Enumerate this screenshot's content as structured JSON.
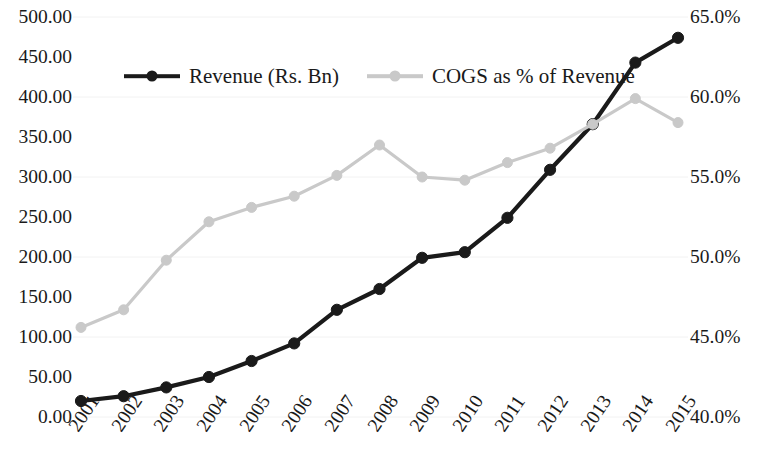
{
  "chart_data": {
    "type": "line",
    "title": "",
    "subtitle": "",
    "xlabel": "",
    "ylabel": "",
    "grid": false,
    "legend_position": "top-left",
    "categories": [
      "2001",
      "2002",
      "2003",
      "2004",
      "2005",
      "2006",
      "2007",
      "2008",
      "2009",
      "2010",
      "2011",
      "2012",
      "2013",
      "2014",
      "2015"
    ],
    "x": [
      2001,
      2002,
      2003,
      2004,
      2005,
      2006,
      2007,
      2008,
      2009,
      2010,
      2011,
      2012,
      2013,
      2014,
      2015
    ],
    "series": [
      {
        "name": "Revenue (Rs. Bn)",
        "axis": "left",
        "color": "#1a1a1a",
        "marker": "circle",
        "values": [
          20,
          26,
          37,
          50,
          70,
          92,
          134,
          160,
          199,
          206,
          249,
          309,
          366,
          443,
          474
        ]
      },
      {
        "name": "COGS as % of Revenue",
        "axis": "right",
        "color": "#c9c9c9",
        "marker": "circle",
        "values": [
          45.6,
          46.7,
          49.8,
          52.2,
          53.1,
          53.8,
          55.1,
          57.0,
          55.0,
          54.8,
          55.9,
          56.8,
          58.3,
          59.9,
          58.4
        ]
      }
    ],
    "y_left": {
      "label": "",
      "min": 0,
      "max": 500,
      "step": 50,
      "ticks": [
        "0.00",
        "50.00",
        "100.00",
        "150.00",
        "200.00",
        "250.00",
        "300.00",
        "350.00",
        "400.00",
        "450.00",
        "500.00"
      ],
      "tick_values": [
        0,
        50,
        100,
        150,
        200,
        250,
        300,
        350,
        400,
        450,
        500
      ]
    },
    "y_right": {
      "label": "",
      "min": 40,
      "max": 65,
      "step": 5,
      "ticks": [
        "40.0%",
        "45.0%",
        "50.0%",
        "55.0%",
        "60.0%",
        "65.0%"
      ],
      "tick_values": [
        40,
        45,
        50,
        55,
        60,
        65
      ]
    },
    "legend": [
      {
        "label": "Revenue (Rs. Bn)",
        "color": "#1a1a1a"
      },
      {
        "label": "COGS as % of Revenue",
        "color": "#c9c9c9"
      }
    ]
  }
}
